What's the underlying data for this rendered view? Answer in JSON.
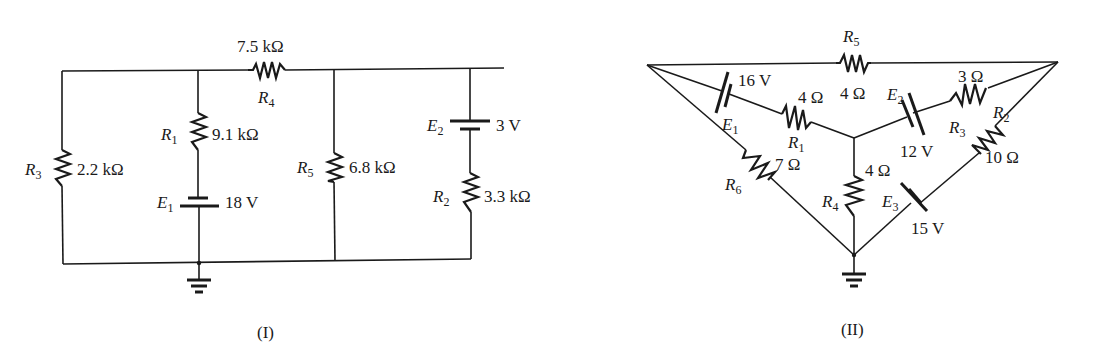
{
  "figures": [
    {
      "caption": "(I)",
      "components": {
        "R1": {
          "name": "R",
          "sub": "1",
          "value": "9.1 kΩ"
        },
        "R2": {
          "name": "R",
          "sub": "2",
          "value": "3.3 kΩ"
        },
        "R3": {
          "name": "R",
          "sub": "3",
          "value": "2.2 kΩ"
        },
        "R4": {
          "name": "R",
          "sub": "4",
          "value": "7.5 kΩ"
        },
        "R5": {
          "name": "R",
          "sub": "5",
          "value": "6.8 kΩ"
        },
        "E1": {
          "name": "E",
          "sub": "1",
          "value": "18 V"
        },
        "E2": {
          "name": "E",
          "sub": "2",
          "value": "3 V"
        }
      }
    },
    {
      "caption": "(II)",
      "components": {
        "R1": {
          "name": "R",
          "sub": "1",
          "value": "4 Ω"
        },
        "R2": {
          "name": "R",
          "sub": "2",
          "value": "3 Ω"
        },
        "R3": {
          "name": "R",
          "sub": "3",
          "value": "10 Ω"
        },
        "R4": {
          "name": "R",
          "sub": "4",
          "value": "4 Ω"
        },
        "R5": {
          "name": "R",
          "sub": "5",
          "value": "4 Ω"
        },
        "R6": {
          "name": "R",
          "sub": "6",
          "value": "7 Ω"
        },
        "E1": {
          "name": "E",
          "sub": "1",
          "value": "16 V"
        },
        "E2": {
          "name": "E",
          "sub": "2",
          "value": "12 V"
        },
        "E3": {
          "name": "E",
          "sub": "3",
          "value": "15 V"
        }
      }
    }
  ]
}
